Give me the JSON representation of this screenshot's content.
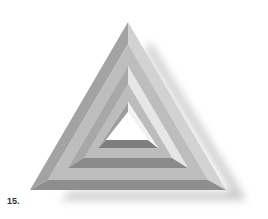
{
  "figure": {
    "label": "15."
  },
  "colors": {
    "background": "#ffffff",
    "dark_face": "#8c8c8c",
    "mid_face": "#a9a9a9",
    "light_face": "#c4c4c4",
    "shadow": "#d6d6d6"
  }
}
